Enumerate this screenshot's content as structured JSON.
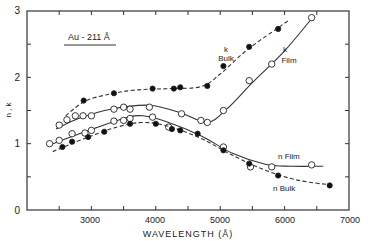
{
  "chart_data": {
    "type": "line",
    "title": "",
    "annotation": "Au - 211 Å",
    "xlabel": "WAVELENGTH (Å)",
    "ylabel": "n , k",
    "xlim": [
      2000,
      7000
    ],
    "ylim": [
      0,
      3
    ],
    "x_ticks": [
      3000,
      4000,
      5000,
      6000,
      7000
    ],
    "y_ticks": [
      0,
      1,
      2,
      3
    ],
    "grid": false,
    "legend": "inline labels",
    "series": [
      {
        "name": "k Bulk",
        "label_lines": [
          "k",
          "Bulk"
        ],
        "style": "dashed",
        "marker": "filled",
        "points": [
          [
            2880,
            1.65
          ],
          [
            3350,
            1.76
          ],
          [
            3950,
            1.83
          ],
          [
            4280,
            1.83
          ],
          [
            4380,
            1.85
          ],
          [
            4800,
            1.87
          ],
          [
            5050,
            2.17
          ],
          [
            5450,
            2.46
          ],
          [
            5900,
            2.73
          ]
        ],
        "curve": [
          [
            2600,
            1.42
          ],
          [
            2900,
            1.64
          ],
          [
            3300,
            1.75
          ],
          [
            3700,
            1.81
          ],
          [
            4200,
            1.83
          ],
          [
            4700,
            1.86
          ],
          [
            5000,
            2.05
          ],
          [
            5400,
            2.4
          ],
          [
            5800,
            2.68
          ],
          [
            6050,
            2.85
          ]
        ]
      },
      {
        "name": "k Film",
        "label_lines": [
          "k",
          "Film"
        ],
        "style": "solid",
        "marker": "open",
        "points": [
          [
            2500,
            1.28
          ],
          [
            2620,
            1.36
          ],
          [
            2750,
            1.42
          ],
          [
            2870,
            1.42
          ],
          [
            3000,
            1.42
          ],
          [
            3350,
            1.52
          ],
          [
            3500,
            1.55
          ],
          [
            3600,
            1.52
          ],
          [
            3900,
            1.55
          ],
          [
            4400,
            1.45
          ],
          [
            4800,
            1.32
          ],
          [
            5050,
            1.5
          ],
          [
            5450,
            1.95
          ],
          [
            5800,
            2.2
          ],
          [
            6420,
            2.9
          ]
        ],
        "curve": [
          [
            2450,
            1.22
          ],
          [
            2800,
            1.38
          ],
          [
            3300,
            1.52
          ],
          [
            3900,
            1.58
          ],
          [
            4400,
            1.46
          ],
          [
            4800,
            1.32
          ],
          [
            5100,
            1.52
          ],
          [
            5500,
            1.92
          ],
          [
            6000,
            2.4
          ],
          [
            6450,
            2.92
          ]
        ]
      },
      {
        "name": "n Film",
        "label_lines": [
          "n Film"
        ],
        "style": "solid",
        "marker": "open",
        "points": [
          [
            2350,
            1.0
          ],
          [
            2500,
            1.05
          ],
          [
            2700,
            1.15
          ],
          [
            2900,
            1.16
          ],
          [
            3000,
            1.2
          ],
          [
            3350,
            1.34
          ],
          [
            3500,
            1.35
          ],
          [
            3600,
            1.38
          ],
          [
            3950,
            1.4
          ],
          [
            4200,
            1.25
          ],
          [
            4700,
            1.35
          ],
          [
            5050,
            0.95
          ],
          [
            5470,
            0.65
          ],
          [
            5800,
            0.65
          ],
          [
            6420,
            0.68
          ]
        ],
        "curve": [
          [
            2400,
            1.0
          ],
          [
            2900,
            1.18
          ],
          [
            3500,
            1.38
          ],
          [
            3800,
            1.42
          ],
          [
            4200,
            1.32
          ],
          [
            4700,
            1.12
          ],
          [
            5200,
            0.85
          ],
          [
            5700,
            0.69
          ],
          [
            6100,
            0.66
          ],
          [
            6600,
            0.66
          ]
        ]
      },
      {
        "name": "n Bulk",
        "label_lines": [
          "n Bulk"
        ],
        "style": "dashed",
        "marker": "filled",
        "points": [
          [
            2550,
            0.95
          ],
          [
            2700,
            1.03
          ],
          [
            2950,
            1.1
          ],
          [
            3200,
            1.18
          ],
          [
            3600,
            1.3
          ],
          [
            4000,
            1.3
          ],
          [
            4250,
            1.22
          ],
          [
            4380,
            1.2
          ],
          [
            4650,
            1.15
          ],
          [
            5050,
            0.9
          ],
          [
            5450,
            0.7
          ],
          [
            5900,
            0.52
          ],
          [
            6700,
            0.37
          ]
        ],
        "curve": [
          [
            2400,
            0.88
          ],
          [
            2900,
            1.08
          ],
          [
            3400,
            1.25
          ],
          [
            3800,
            1.32
          ],
          [
            4200,
            1.26
          ],
          [
            4700,
            1.08
          ],
          [
            5200,
            0.82
          ],
          [
            5700,
            0.6
          ],
          [
            6200,
            0.45
          ],
          [
            6700,
            0.38
          ]
        ]
      }
    ]
  },
  "labels": {
    "annotation": "Au - 211 Å",
    "xlabel": "WAVELENGTH (Å)",
    "ylabel": "n , k",
    "k_bulk_k": "k",
    "k_bulk_name": "Bulk",
    "k_film_k": "k",
    "k_film_name": "Film",
    "n_film": "n Film",
    "n_bulk": "n Bulk",
    "x3000": "3000",
    "x4000": "4000",
    "x5000": "5000",
    "x6000": "6000",
    "x7000": "7000",
    "y0": "0",
    "y1": "1",
    "y2": "2",
    "y3": "3"
  }
}
